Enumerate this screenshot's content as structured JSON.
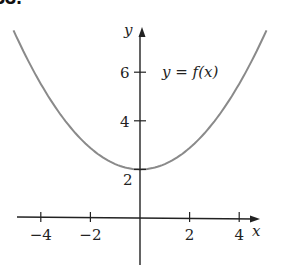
{
  "problem_number": "33.",
  "chart_data": {
    "type": "line",
    "title": "",
    "curve_label": "y = f(x)",
    "xlabel": "x",
    "ylabel": "y",
    "xlim": [
      -4.5,
      5
    ],
    "ylim": [
      -1.8,
      7.5
    ],
    "x_ticks": [
      -4,
      -2,
      2,
      4
    ],
    "x_tick_labels": [
      "−4",
      "−2",
      "2",
      "4"
    ],
    "y_ticks": [
      2,
      4,
      6
    ],
    "y_tick_labels": [
      "2",
      "4",
      "6"
    ],
    "grid": false,
    "legend": "none",
    "series": [
      {
        "name": "y = f(x)",
        "color": "#8a8a8a",
        "description": "upward-opening parabola with vertex (0, 2)",
        "x": [
          -4.8,
          -4,
          -3,
          -2,
          -1,
          0,
          1,
          2,
          3,
          4,
          4.8
        ],
        "y": [
          7.1,
          5.5,
          4.0,
          2.9,
          2.2,
          2.0,
          2.2,
          2.9,
          4.0,
          5.5,
          7.1
        ]
      }
    ]
  }
}
